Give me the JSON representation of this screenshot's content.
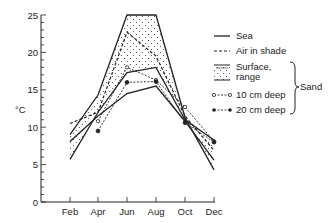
{
  "chart_data": {
    "type": "line",
    "title": "",
    "xlabel": "",
    "ylabel": "°C",
    "ylim": [
      0,
      25
    ],
    "yticks": [
      0,
      5,
      10,
      15,
      20,
      25
    ],
    "categories": [
      "Feb",
      "Apr",
      "Jun",
      "Aug",
      "Oct",
      "Dec"
    ],
    "grid": false,
    "legend_position": "right",
    "series": [
      {
        "name": "Sea",
        "style": "solid",
        "values": [
          8.1,
          11.5,
          14.5,
          15.5,
          10.8,
          5.6
        ]
      },
      {
        "name": "Air in shade",
        "style": "dashed",
        "values": [
          10.5,
          12.0,
          22.7,
          19.5,
          11.5,
          6.9
        ]
      },
      {
        "name": "Surface, range (max)",
        "style": "solid",
        "group": "Sand",
        "values": [
          9.0,
          14.3,
          25.0,
          25.0,
          11.3,
          4.3
        ]
      },
      {
        "name": "Surface, range (min)",
        "style": "solid",
        "group": "Sand",
        "values": [
          5.7,
          12.0,
          17.3,
          18.0,
          11.0,
          8.3
        ]
      },
      {
        "name": "10 cm deep",
        "style": "dash-open-circle",
        "group": "Sand",
        "values": [
          null,
          10.8,
          18.0,
          16.3,
          12.7,
          8.1
        ]
      },
      {
        "name": "20 cm deep",
        "style": "dash-filled-circle",
        "group": "Sand",
        "values": [
          null,
          9.5,
          16.0,
          16.1,
          10.6,
          8.0
        ]
      }
    ],
    "legend": {
      "entries": [
        "Sea",
        "Air in shade",
        "Surface, range",
        "10 cm deep",
        "20 cm deep"
      ],
      "bracket_label": "Sand"
    }
  },
  "axis": {
    "y_title": "°C",
    "y_ticks": [
      "0",
      "5",
      "10",
      "15",
      "20",
      "25"
    ],
    "x_ticks": [
      "Feb",
      "Apr",
      "Jun",
      "Aug",
      "Oct",
      "Dec"
    ]
  },
  "legend": {
    "sea": "Sea",
    "air": "Air in shade",
    "surface_1": "Surface,",
    "surface_2": "range",
    "cm10": "10 cm  deep",
    "cm20": "20 cm  deep",
    "sand": "Sand"
  }
}
